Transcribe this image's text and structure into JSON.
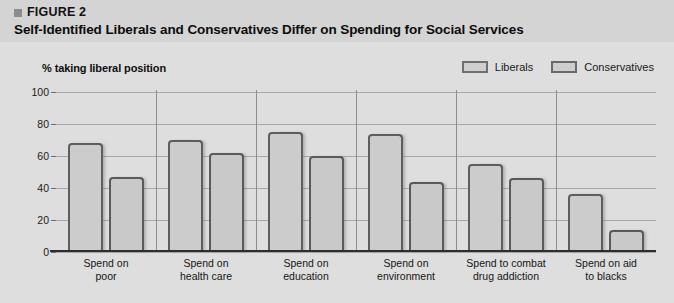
{
  "figure": {
    "marker": "square-marker",
    "label": "FIGURE 2",
    "title": "Self-Identified Liberals and Conservatives Differ on Spending for Social Services"
  },
  "chart_data": {
    "type": "bar",
    "title": "Self-Identified Liberals and Conservatives Differ on Spending for Social Services",
    "ylabel": "% taking liberal position",
    "xlabel": "",
    "ylim": [
      0,
      100
    ],
    "yticks": [
      0,
      20,
      40,
      60,
      80,
      100
    ],
    "grid": true,
    "legend_position": "top-right",
    "categories": [
      "Spend on poor",
      "Spend on health care",
      "Spend on education",
      "Spend on environment",
      "Spend to combat drug addiction",
      "Spend on aid to blacks"
    ],
    "category_lines": [
      [
        "Spend on",
        "poor"
      ],
      [
        "Spend on",
        "health care"
      ],
      [
        "Spend on",
        "education"
      ],
      [
        "Spend on",
        "environment"
      ],
      [
        "Spend to combat",
        "drug addiction"
      ],
      [
        "Spend on aid",
        "to blacks"
      ]
    ],
    "series": [
      {
        "name": "Liberals",
        "values": [
          68,
          70,
          75,
          74,
          55,
          36
        ]
      },
      {
        "name": "Conservatives",
        "values": [
          47,
          62,
          60,
          44,
          46,
          14
        ]
      }
    ],
    "colors": {
      "bar_fill": "#cccccc",
      "bar_border": "#5e5e5e",
      "panel_background": "#dedede",
      "header_background": "#d4d4d4",
      "gridline": "#a8a8a8",
      "axis": "#2e2e2e"
    }
  }
}
